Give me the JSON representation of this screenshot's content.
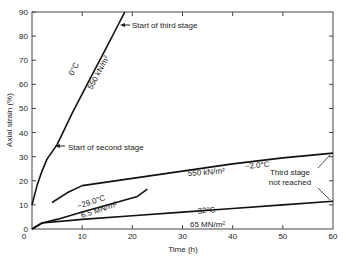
{
  "chart_data": {
    "type": "line",
    "title": "",
    "xlabel": "Time (h)",
    "ylabel": "Axial strain (%)",
    "xlim": [
      0,
      60
    ],
    "ylim": [
      0,
      90
    ],
    "xticks": [
      0,
      10,
      20,
      30,
      40,
      50,
      60
    ],
    "yticks": [
      0,
      10,
      20,
      30,
      40,
      50,
      60,
      70,
      80,
      90
    ],
    "grid": false,
    "series": [
      {
        "name": "0°C 550 kN/m²",
        "temp": "0°C",
        "stress": "550 kN/m²",
        "x": [
          0,
          1,
          2,
          3,
          5,
          8,
          12,
          15,
          17,
          18,
          18.5
        ],
        "y": [
          10,
          18,
          24,
          29,
          35,
          48,
          64,
          76,
          84,
          88,
          90
        ]
      },
      {
        "name": "-2.0°C 550 kN/m²",
        "temp": "−2.0°C",
        "stress": "550 kN/m²",
        "x": [
          4,
          7,
          10,
          20,
          30,
          40,
          50,
          60
        ],
        "y": [
          11,
          15,
          18,
          21,
          24,
          27,
          29.5,
          31.5
        ]
      },
      {
        "name": "-29.0°C 6.5 MN/m²",
        "temp": "−29.0°C",
        "stress": "6.5 MN/m²",
        "x": [
          0,
          2,
          5,
          10,
          15,
          21,
          23
        ],
        "y": [
          0,
          2.5,
          4,
          7,
          10,
          13.5,
          16.5
        ]
      },
      {
        "name": "-32°C 65 MN/m²",
        "temp": "−32°C",
        "stress": "65 MN/m²",
        "x": [
          0,
          2,
          10,
          20,
          30,
          40,
          50,
          60
        ],
        "y": [
          0,
          2.5,
          4,
          5.5,
          7,
          8.5,
          10,
          11.5
        ]
      }
    ],
    "annotations": [
      {
        "text": "Start of third stage",
        "x": 18,
        "y": 86
      },
      {
        "text": "Start of second stage",
        "x": 5,
        "y": 35
      },
      {
        "text": "Third stage not reached",
        "x": 53,
        "y": 22
      }
    ]
  },
  "labels": {
    "xlabel": "Time (h)",
    "ylabel": "Axial strain (%)",
    "third_stage": "Start of third stage",
    "second_stage": "Start of second stage",
    "not_reached_1": "Third stage",
    "not_reached_2": "not reached",
    "s0_temp": "0°C",
    "s0_stress": "550 kN/m²",
    "s1_temp": "−2.0°C",
    "s1_stress": "550 kN/m²",
    "s2_temp": "−29.0°C",
    "s2_stress": "6.5 MN/m²",
    "s3_temp": "−32°C",
    "s3_stress": "65 MN/m²"
  }
}
